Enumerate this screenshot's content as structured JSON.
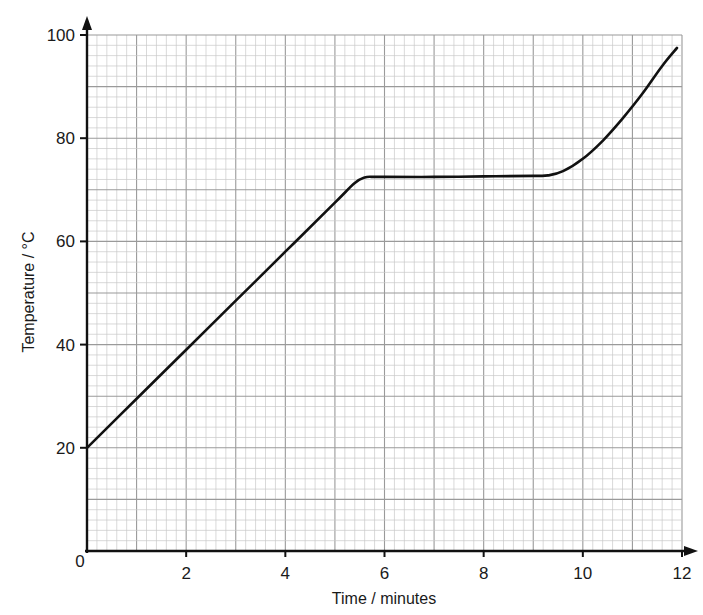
{
  "chart_data": {
    "type": "line",
    "title": "",
    "xlabel": "Time / minutes",
    "ylabel": "Temperature / °C",
    "xlim": [
      0,
      12
    ],
    "ylim": [
      0,
      100
    ],
    "x_ticks": [
      0,
      2,
      4,
      6,
      8,
      10,
      12
    ],
    "y_ticks": [
      20,
      40,
      60,
      80,
      100
    ],
    "x_tick_labels": [
      "0",
      "2",
      "4",
      "6",
      "8",
      "10",
      "12"
    ],
    "y_tick_labels": [
      "20",
      "40",
      "60",
      "80",
      "100"
    ],
    "grid": {
      "on": true,
      "minor_step_x": 0.2,
      "minor_step_y": 2,
      "major_step_x": 1,
      "major_step_y": 10
    },
    "legend": null,
    "series": [
      {
        "name": "Temperature",
        "color": "#111111",
        "x": [
          0,
          1,
          2,
          3,
          4,
          5,
          5.4,
          5.6,
          5.8,
          6,
          7,
          8,
          9,
          9.3,
          9.6,
          10,
          10.4,
          10.8,
          11.2,
          11.6,
          11.9
        ],
        "y": [
          20,
          29.5,
          39,
          48.5,
          58,
          67.5,
          71.3,
          72.4,
          72.5,
          72.5,
          72.5,
          72.6,
          72.7,
          72.8,
          73.6,
          76,
          79.5,
          83.8,
          88.6,
          94,
          97.5
        ]
      }
    ]
  },
  "axes": {
    "x_title": "Time / minutes",
    "y_title": "Temperature / °C",
    "origin_label": "0"
  },
  "colors": {
    "grid_minor": "#c8c8c8",
    "grid_major": "#9a9a9a",
    "axis": "#111111",
    "curve": "#111111"
  }
}
